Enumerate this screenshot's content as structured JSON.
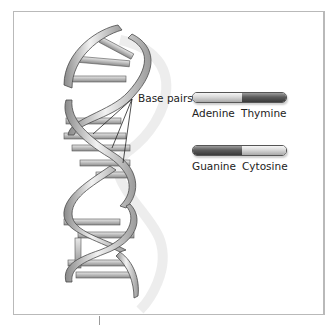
{
  "diagram": {
    "callout": {
      "label": "Base pairs"
    },
    "legend": [
      {
        "left_base": "Adenine",
        "right_base": "Thymine",
        "left_shade": "light",
        "right_shade": "dark"
      },
      {
        "left_base": "Guanine",
        "right_base": "Cytosine",
        "left_shade": "dark",
        "right_shade": "light"
      }
    ],
    "colors": {
      "light_base": "#d8d8d8",
      "dark_base": "#5c5c5c",
      "backbone": "#c8c8c8",
      "frame": "#b9b9b9"
    },
    "icons": {
      "figure": "dna-double-helix-icon"
    }
  }
}
